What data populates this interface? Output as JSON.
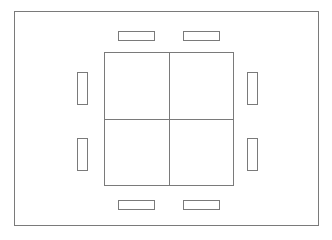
{
  "diagram": {
    "background_color": "#ffffff",
    "line_color": "#7a7a7a",
    "outer_frame": {
      "name": "outer-enclosure",
      "x": 14,
      "y": 11,
      "width": 305,
      "height": 215
    },
    "panel": {
      "name": "center-panel",
      "x": 104,
      "y": 52,
      "width": 130,
      "height": 134,
      "quadrants": 4,
      "divider_x": 169,
      "divider_y": 119
    },
    "tabs": [
      {
        "name": "tab-top-left",
        "orientation": "horizontal",
        "x": 118,
        "y": 31,
        "width": 37,
        "height": 10
      },
      {
        "name": "tab-top-right",
        "orientation": "horizontal",
        "x": 183,
        "y": 31,
        "width": 37,
        "height": 10
      },
      {
        "name": "tab-bottom-left",
        "orientation": "horizontal",
        "x": 118,
        "y": 200,
        "width": 37,
        "height": 10
      },
      {
        "name": "tab-bottom-right",
        "orientation": "horizontal",
        "x": 183,
        "y": 200,
        "width": 37,
        "height": 10
      },
      {
        "name": "tab-left-upper",
        "orientation": "vertical",
        "x": 77,
        "y": 72,
        "width": 11,
        "height": 33
      },
      {
        "name": "tab-left-lower",
        "orientation": "vertical",
        "x": 77,
        "y": 138,
        "width": 11,
        "height": 33
      },
      {
        "name": "tab-right-upper",
        "orientation": "vertical",
        "x": 247,
        "y": 72,
        "width": 11,
        "height": 33
      },
      {
        "name": "tab-right-lower",
        "orientation": "vertical",
        "x": 247,
        "y": 138,
        "width": 11,
        "height": 33
      }
    ]
  }
}
